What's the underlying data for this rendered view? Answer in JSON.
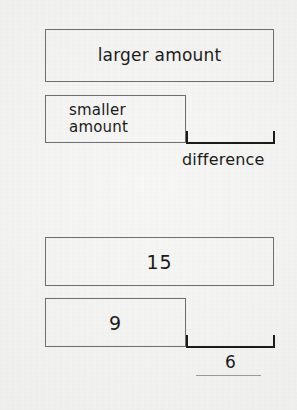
{
  "diagram": {
    "background_color": "#f3f3f2",
    "line_color": "#6d6d70",
    "ink_color": "#1b1b1b",
    "top_model": {
      "larger_bar_label": "larger amount",
      "smaller_bar_label": "smaller\namount",
      "bracket_label": "difference"
    },
    "bottom_model": {
      "larger_bar_value": "15",
      "smaller_bar_value": "9",
      "bracket_value": "6"
    }
  },
  "chart_data": {
    "type": "bar",
    "orientation": "horizontal",
    "models": [
      {
        "name": "abstract",
        "categories": [
          "larger amount",
          "smaller amount"
        ],
        "labels": [
          "larger amount",
          "smaller amount"
        ],
        "annotations": [
          "difference"
        ]
      },
      {
        "name": "numeric",
        "categories": [
          "15",
          "9"
        ],
        "values": [
          15,
          9
        ],
        "annotations": [
          "6"
        ],
        "relation": "15 - 9 = 6"
      }
    ],
    "xlabel": "",
    "ylabel": "",
    "grid": false,
    "legend": "none"
  }
}
